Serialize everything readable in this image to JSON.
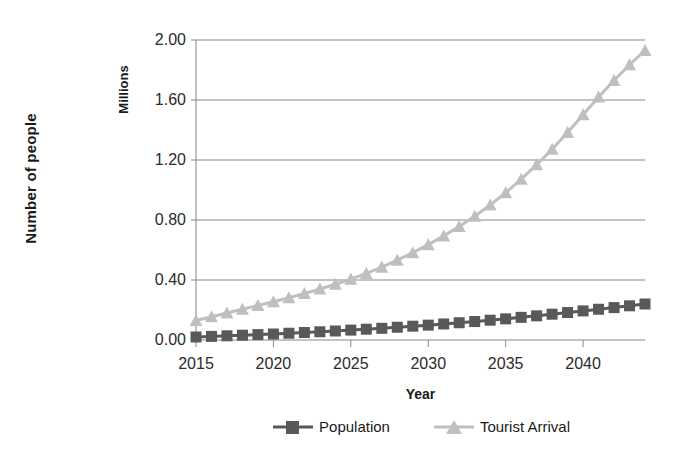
{
  "chart_data": {
    "type": "line",
    "title": "",
    "xlabel": "Year",
    "ylabel": "Number of people",
    "yunit": "Millions",
    "xlim": [
      2015,
      2044
    ],
    "ylim": [
      0.0,
      2.0
    ],
    "grid": true,
    "legend_position": "bottom",
    "y_ticks": [
      "0.00",
      "0.40",
      "0.80",
      "1.20",
      "1.60",
      "2.00"
    ],
    "y_tick_values": [
      0.0,
      0.4,
      0.8,
      1.2,
      1.6,
      2.0
    ],
    "x_ticks": [
      "2015",
      "2020",
      "2025",
      "2030",
      "2035",
      "2040"
    ],
    "x_tick_values": [
      2015,
      2020,
      2025,
      2030,
      2035,
      2040
    ],
    "x": [
      2015,
      2016,
      2017,
      2018,
      2019,
      2020,
      2021,
      2022,
      2023,
      2024,
      2025,
      2026,
      2027,
      2028,
      2029,
      2030,
      2031,
      2032,
      2033,
      2034,
      2035,
      2036,
      2037,
      2038,
      2039,
      2040,
      2041,
      2042,
      2043,
      2044
    ],
    "series": [
      {
        "name": "Population",
        "color": "#595959",
        "marker": "square",
        "values": [
          0.02,
          0.024,
          0.028,
          0.032,
          0.036,
          0.04,
          0.045,
          0.05,
          0.055,
          0.06,
          0.066,
          0.072,
          0.078,
          0.085,
          0.092,
          0.099,
          0.107,
          0.115,
          0.123,
          0.132,
          0.141,
          0.151,
          0.161,
          0.172,
          0.183,
          0.194,
          0.205,
          0.216,
          0.228,
          0.24
        ]
      },
      {
        "name": "Tourist Arrival",
        "color": "#bfbfbf",
        "marker": "triangle",
        "values": [
          0.13,
          0.155,
          0.18,
          0.205,
          0.23,
          0.255,
          0.282,
          0.31,
          0.34,
          0.372,
          0.406,
          0.444,
          0.486,
          0.532,
          0.582,
          0.636,
          0.694,
          0.757,
          0.825,
          0.9,
          0.982,
          1.072,
          1.168,
          1.272,
          1.384,
          1.502,
          1.62,
          1.73,
          1.835,
          1.93
        ]
      }
    ]
  },
  "axes": {
    "y_title": "Number of people",
    "y_unit": "Millions",
    "x_title": "Year"
  },
  "legend": {
    "items": [
      {
        "label": "Population"
      },
      {
        "label": "Tourist Arrival"
      }
    ]
  }
}
